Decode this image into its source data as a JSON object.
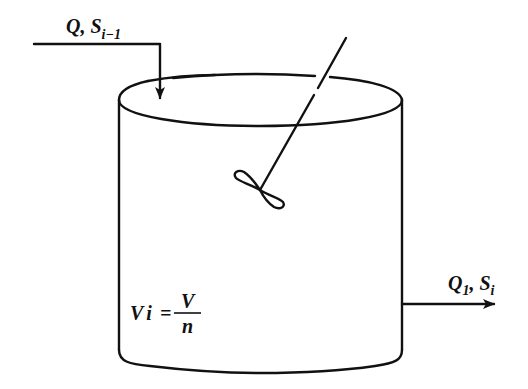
{
  "diagram": {
    "colors": {
      "ink": "#111111",
      "background": "#ffffff"
    },
    "inlet": {
      "label_main": "Q, S",
      "label_sub": "i−1"
    },
    "outlet": {
      "label_q": "Q",
      "label_q_sub": "1",
      "label_sep": ", S",
      "label_s_sub": "i"
    },
    "volume": {
      "lhs_main": "V",
      "lhs_sub": "i",
      "equals": "=",
      "numerator": "V",
      "denominator": "n"
    },
    "components": [
      "tank",
      "stirrer-shaft",
      "impeller",
      "inlet-arrow",
      "outlet-arrow"
    ]
  }
}
